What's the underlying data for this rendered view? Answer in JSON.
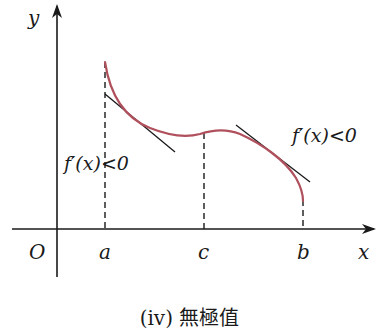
{
  "figure": {
    "axes": {
      "y_label": "y",
      "x_label": "x",
      "origin_label": "O"
    },
    "points": {
      "a": "a",
      "c": "c",
      "b": "b"
    },
    "annotations": {
      "left": "f′(x)<0",
      "right": "f′(x)<0"
    },
    "caption": "(iv) 無極值",
    "colors": {
      "curve": "#b0505c",
      "axes": "#1a1a1a",
      "tangent": "#1a1a1a"
    }
  }
}
